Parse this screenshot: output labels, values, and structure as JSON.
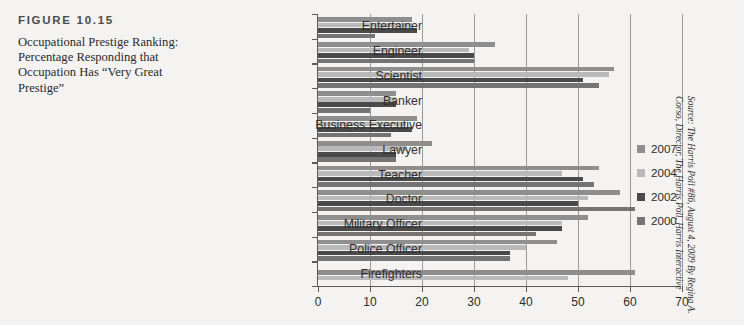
{
  "figure": {
    "label": "FIGURE 10.15",
    "caption": "Occupational Prestige Ranking: Percentage Responding that Occupation Has “Very Great Prestige”"
  },
  "source_note": "Source: The Harris Poll #86, August 4, 2009 By Regina A. Corso, Director, The Harris Poll, Harris Interactive",
  "legend": {
    "position": "right",
    "entries": [
      {
        "label": "2007",
        "color": "#8e8e8e"
      },
      {
        "label": "2004",
        "color": "#b9b9b9"
      },
      {
        "label": "2002",
        "color": "#4a4a4a"
      },
      {
        "label": "2000",
        "color": "#747474"
      }
    ]
  },
  "chart_data": {
    "type": "bar",
    "orientation": "horizontal",
    "title": "Occupational Prestige Ranking: Percentage Responding that Occupation Has “Very Great Prestige”",
    "xlabel": "",
    "ylabel": "",
    "xlim": [
      0,
      70
    ],
    "xticks": [
      0,
      10,
      20,
      30,
      40,
      50,
      60,
      70
    ],
    "grid": true,
    "grid_axis": "x",
    "categories": [
      "Entertainer",
      "Engineer",
      "Scientist",
      "Banker",
      "Business Executive",
      "Lawyer",
      "Teacher",
      "Doctor",
      "Military Officer",
      "Police Officer",
      "Firefighters"
    ],
    "series": [
      {
        "name": "2007",
        "color": "#8e8e8e",
        "values": [
          18,
          34,
          57,
          15,
          19,
          22,
          54,
          58,
          52,
          46,
          61
        ]
      },
      {
        "name": "2004",
        "color": "#b9b9b9",
        "values": [
          18,
          29,
          56,
          15,
          17,
          17,
          47,
          52,
          47,
          40,
          48
        ]
      },
      {
        "name": "2002",
        "color": "#4a4a4a",
        "values": [
          19,
          30,
          51,
          15,
          18,
          15,
          51,
          50,
          47,
          37,
          null
        ]
      },
      {
        "name": "2000",
        "color": "#747474",
        "values": [
          11,
          30,
          54,
          10,
          14,
          15,
          53,
          61,
          42,
          37,
          null
        ]
      }
    ]
  }
}
